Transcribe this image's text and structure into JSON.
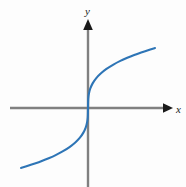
{
  "figure": {
    "width": 186,
    "height": 187,
    "background_color": "#fdfdfd",
    "axis_color": "#808080",
    "arrow_color": "#1a1a1a",
    "curve_color": "#2e75b6",
    "label_color": "#1a1a1a"
  },
  "axes": {
    "x_label": "x",
    "y_label": "y",
    "origin_px": {
      "x": 88,
      "y": 108
    },
    "x_axis_px": {
      "start_x": 10,
      "end_x": 172,
      "y": 108
    },
    "y_axis_px": {
      "x": 88,
      "start_y": 20,
      "end_y": 187
    }
  },
  "chart_data": {
    "type": "line",
    "title": "",
    "subtitle": "",
    "xlabel": "x",
    "ylabel": "y",
    "function": "y = x^(1/3)",
    "grid": false,
    "legend": null,
    "legend_position": "none",
    "axis_arrows": true,
    "tick_labels": [],
    "xlim": [
      -3.4,
      3.4
    ],
    "ylim": [
      -3.4,
      3.4
    ],
    "series": [
      {
        "name": "y = x^(1/3)",
        "color": "#2e75b6",
        "x": [
          -2.9,
          -2.6,
          -2.3,
          -2.0,
          -1.7,
          -1.4,
          -1.1,
          -0.8,
          -0.55,
          -0.35,
          -0.2,
          -0.1,
          -0.04,
          -0.01,
          0.0,
          0.01,
          0.04,
          0.1,
          0.2,
          0.35,
          0.55,
          0.8,
          1.1,
          1.4,
          1.7,
          2.0,
          2.3,
          2.6,
          2.9
        ],
        "y": [
          -1.426,
          -1.375,
          -1.32,
          -1.26,
          -1.193,
          -1.119,
          -1.032,
          -0.928,
          -0.819,
          -0.705,
          -0.585,
          -0.464,
          -0.342,
          -0.215,
          0.0,
          0.215,
          0.342,
          0.464,
          0.585,
          0.705,
          0.819,
          0.928,
          1.032,
          1.119,
          1.193,
          1.26,
          1.32,
          1.375,
          1.426
        ]
      }
    ],
    "endpoints_px": {
      "left": {
        "x": 22,
        "y": 170
      },
      "right": {
        "x": 155,
        "y": 48
      }
    }
  }
}
